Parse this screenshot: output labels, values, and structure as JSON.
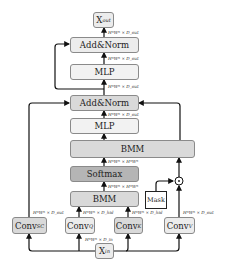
{
  "diagram": {
    "nodes": {
      "x_out": {
        "main": "X",
        "sub": "out"
      },
      "addnorm_top": "Add&Norm",
      "mlp_top": "MLP",
      "addnorm_mid": "Add&Norm",
      "mlp_mid": "MLP",
      "bmm_big": "BMM",
      "softmax": "Softmax",
      "bmm_small": "BMM",
      "mask": "Mask",
      "multiply_op": "⊙",
      "conv_sc": {
        "main": "Conv",
        "sub": "SC"
      },
      "conv_q": {
        "main": "Conv",
        "sub": "Q"
      },
      "conv_k": {
        "main": "Conv",
        "sub": "K"
      },
      "conv_v": {
        "main": "Conv",
        "sub": "V"
      },
      "x_in": {
        "main": "X",
        "sub": "in"
      }
    },
    "edge_labels": {
      "to_xout": "H*W* × D_out",
      "to_addnorm_top": "H*W* × D_out",
      "to_mlp_top": "H*W* × D_out",
      "to_addnorm_mid": "H*W* × D_out",
      "to_bmm_big": "H*W* × H*W*",
      "to_softmax": "H*W* × H*W*",
      "conv_sc_out": "H*W* × D_out",
      "conv_q_out": "H*W* × D_hid",
      "conv_k_out": "H*W* × D_hid",
      "conv_v_out": "H*W* × D_out",
      "x_in_out": "H*W* × D_in"
    }
  }
}
